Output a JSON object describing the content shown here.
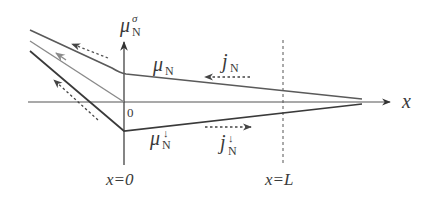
{
  "diagram": {
    "type": "spin chemical potential profile",
    "axes": {
      "y_label": "μ",
      "y_label_sub": "N",
      "y_label_sup": "σ",
      "x_label": "x",
      "origin_label": "0"
    },
    "curves": [
      {
        "id": "mu-up",
        "label": "μ",
        "sub": "N",
        "sup": "",
        "color": "#5a5a5a"
      },
      {
        "id": "mu-mid",
        "label": "",
        "color": "#8a8a8a"
      },
      {
        "id": "mu-down",
        "label": "μ",
        "sub": "N",
        "sup": "↓",
        "color": "#3a3a3a"
      }
    ],
    "currents": [
      {
        "id": "j-up",
        "label": "j",
        "sub": "N",
        "sup": "",
        "direction": "left"
      },
      {
        "id": "j-down",
        "label": "j",
        "sub": "N",
        "sup": "↓",
        "direction": "right"
      }
    ],
    "markers": [
      {
        "id": "x0",
        "text": "x=0"
      },
      {
        "id": "xL",
        "text": "x=L"
      }
    ],
    "colors": {
      "axis": "#3a3a3a",
      "line_dark": "#3a3a3a",
      "line_mid": "#6a6a6a",
      "line_light": "#9a9a9a",
      "arrow": "#4a4a4a"
    }
  }
}
